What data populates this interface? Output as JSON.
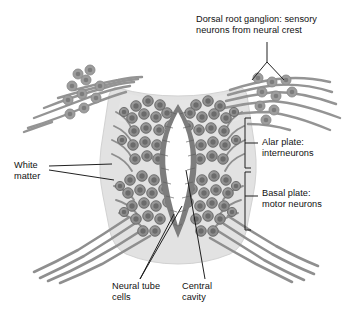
{
  "figure": {
    "type": "anatomical-diagram",
    "background": "#ffffff"
  },
  "colors": {
    "mantle_fill": "#e2e2e2",
    "mantle_stroke": "#cccccc",
    "cell_body": "#8a8a8a",
    "cell_nucleus": "#6e6e6e",
    "cell_stroke": "#6a6a6a",
    "tube_cell": "#7d7d7d",
    "nerve_fiber": "#8c8c8c",
    "cavity_fill": "#ffffff",
    "leader_line": "#1a1a1a",
    "text": "#111111"
  },
  "labels": {
    "dorsal_root_ganglion": "Dorsal root ganglion: sensory\nneurons from neural crest",
    "alar_plate": "Alar plate:\ninterneurons",
    "basal_plate": "Basal plate:\nmotor neurons",
    "white_matter": "White\nmatter",
    "neural_tube_cells": "Neural tube\ncells",
    "central_cavity": "Central\ncavity"
  },
  "structures": {
    "mantle": "gray-matter-mantle",
    "central_cavity": "central-canal-lumen",
    "neural_tube_layer": "columnar-ependymal-layer",
    "dorsal_root_ganglion_left": "left-sensory-ganglion-cluster",
    "dorsal_root_ganglion_right": "right-sensory-ganglion-cluster",
    "dorsal_roots": "sensory-nerve-fibers",
    "ventral_roots": "motor-nerve-fibers"
  },
  "brackets": {
    "alar": {
      "label_ref": "alar_plate",
      "span": "upper-half"
    },
    "basal": {
      "label_ref": "basal_plate",
      "span": "lower-half"
    }
  }
}
